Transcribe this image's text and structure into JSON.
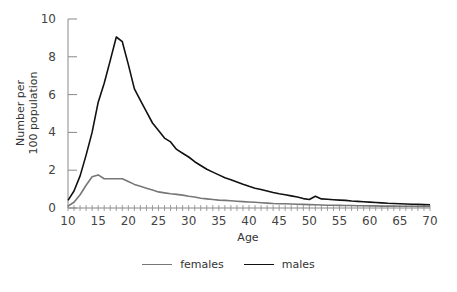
{
  "chart_data": {
    "type": "line",
    "title": "",
    "xlabel": "Age",
    "ylabel": "Number per 100 population",
    "ylabel_lines": [
      "Number per",
      "100 population"
    ],
    "xlim": [
      10,
      70
    ],
    "ylim": [
      0,
      10
    ],
    "x_ticks": [
      10,
      15,
      20,
      25,
      30,
      35,
      40,
      45,
      50,
      55,
      60,
      65,
      70
    ],
    "y_ticks": [
      0,
      2,
      4,
      6,
      8,
      10
    ],
    "grid": false,
    "legend_position": "bottom",
    "x": [
      10,
      11,
      12,
      13,
      14,
      15,
      16,
      17,
      18,
      19,
      20,
      21,
      22,
      23,
      24,
      25,
      26,
      27,
      28,
      29,
      30,
      31,
      32,
      33,
      34,
      35,
      36,
      37,
      38,
      39,
      40,
      41,
      42,
      43,
      44,
      45,
      46,
      47,
      48,
      49,
      50,
      51,
      52,
      53,
      54,
      55,
      56,
      57,
      58,
      59,
      60,
      61,
      62,
      63,
      64,
      65,
      66,
      67,
      68,
      69,
      70
    ],
    "series": [
      {
        "name": "females",
        "color": "#777777",
        "values": [
          0.1,
          0.3,
          0.7,
          1.2,
          1.65,
          1.75,
          1.55,
          1.55,
          1.55,
          1.55,
          1.4,
          1.25,
          1.15,
          1.05,
          0.95,
          0.85,
          0.8,
          0.75,
          0.72,
          0.68,
          0.62,
          0.58,
          0.52,
          0.48,
          0.45,
          0.42,
          0.4,
          0.38,
          0.36,
          0.34,
          0.32,
          0.3,
          0.28,
          0.26,
          0.24,
          0.23,
          0.22,
          0.21,
          0.2,
          0.19,
          0.18,
          0.17,
          0.16,
          0.15,
          0.15,
          0.14,
          0.13,
          0.13,
          0.12,
          0.12,
          0.11,
          0.11,
          0.1,
          0.1,
          0.1,
          0.09,
          0.09,
          0.09,
          0.08,
          0.08,
          0.08
        ]
      },
      {
        "name": "males",
        "color": "#111111",
        "values": [
          0.4,
          0.9,
          1.7,
          2.8,
          4.0,
          5.6,
          6.6,
          7.8,
          9.05,
          8.8,
          7.6,
          6.3,
          5.7,
          5.1,
          4.5,
          4.1,
          3.7,
          3.5,
          3.1,
          2.9,
          2.7,
          2.45,
          2.25,
          2.05,
          1.9,
          1.75,
          1.6,
          1.5,
          1.38,
          1.26,
          1.15,
          1.05,
          0.98,
          0.9,
          0.82,
          0.75,
          0.7,
          0.64,
          0.58,
          0.5,
          0.45,
          0.62,
          0.48,
          0.46,
          0.44,
          0.42,
          0.4,
          0.37,
          0.35,
          0.33,
          0.31,
          0.29,
          0.27,
          0.25,
          0.24,
          0.22,
          0.21,
          0.2,
          0.19,
          0.18,
          0.17
        ]
      }
    ]
  }
}
